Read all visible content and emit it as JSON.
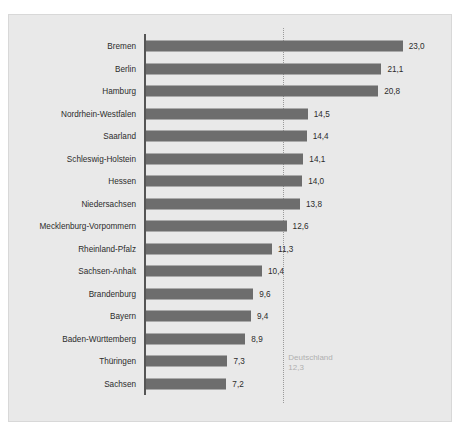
{
  "chart_data": {
    "type": "bar",
    "orientation": "horizontal",
    "title": "",
    "subtitle": "",
    "xlabel": "",
    "ylabel": "",
    "xlim": [
      0,
      25
    ],
    "grid": false,
    "legend": null,
    "categories": [
      "Bremen",
      "Berlin",
      "Hamburg",
      "Nordrhein-Westfalen",
      "Saarland",
      "Schleswig-Holstein",
      "Hessen",
      "Niedersachsen",
      "Mecklenburg-Vorpommern",
      "Rheinland-Pfalz",
      "Sachsen-Anhalt",
      "Brandenburg",
      "Bayern",
      "Baden-Württemberg",
      "Thüringen",
      "Sachsen"
    ],
    "values": [
      23.0,
      21.1,
      20.8,
      14.5,
      14.4,
      14.1,
      14.0,
      13.8,
      12.6,
      11.3,
      10.4,
      9.6,
      9.4,
      8.9,
      7.3,
      7.2
    ],
    "value_labels": [
      "23,0",
      "21,1",
      "20,8",
      "14,5",
      "14,4",
      "14,1",
      "14,0",
      "13,8",
      "12,6",
      "11,3",
      "10,4",
      "9,6",
      "9,4",
      "8,9",
      "7,3",
      "7,2"
    ],
    "reference_line": {
      "name": "Deutschland",
      "value": 12.3,
      "value_label": "12,3",
      "style": "dotted"
    },
    "colors": {
      "bar": "#6d6d6d",
      "background": "#e9e9e9",
      "axis": "#555555",
      "reference_line": "#9a9a9a",
      "reference_label": "#b0b0b0",
      "text": "#2c2c2c"
    }
  }
}
